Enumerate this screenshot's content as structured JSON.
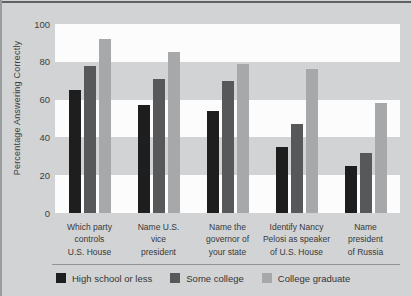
{
  "figure": {
    "ylabel": "Percentage Answering Correctly"
  },
  "chart_data": {
    "type": "bar",
    "title": "",
    "xlabel": "",
    "ylabel": "Percentage Answering Correctly",
    "ylim": [
      0,
      100
    ],
    "yticks": [
      100,
      80,
      60,
      40,
      20,
      0
    ],
    "grid": "alternating horizontal bands (white / gray) every 20 units",
    "legend_position": "bottom",
    "categories": [
      "Which party\ncontrols\nU.S. House",
      "Name U.S.\nvice\npresident",
      "Name the\ngovernor of\nyour state",
      "Identify Nancy\nPelosi as speaker\nof U.S. House",
      "Name\npresident\nof Russia"
    ],
    "series": [
      {
        "name": "High school or less",
        "color": "#1e1e1e",
        "values": [
          65,
          57,
          54,
          35,
          25
        ]
      },
      {
        "name": "Some college",
        "color": "#56585a",
        "values": [
          78,
          71,
          70,
          47,
          32
        ]
      },
      {
        "name": "College graduate",
        "color": "#a6a8aa",
        "values": [
          92,
          85,
          79,
          76,
          58
        ]
      }
    ],
    "colors": {
      "background": "#d2d3d4",
      "band_light": "#fcfcfd",
      "band_gray": "#d2d3d4",
      "text": "#3c3e40",
      "top_border": "#5f6163",
      "divider": "#8f9596"
    }
  }
}
